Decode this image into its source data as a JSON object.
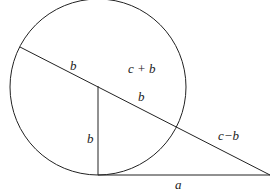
{
  "diagram": {
    "labels": {
      "upper_b": "b",
      "c_plus_b": "c + b",
      "lower_b": "b",
      "vertical_b": "b",
      "c_minus_b": "c−b",
      "a": "a"
    },
    "stroke_color": "#222222"
  }
}
